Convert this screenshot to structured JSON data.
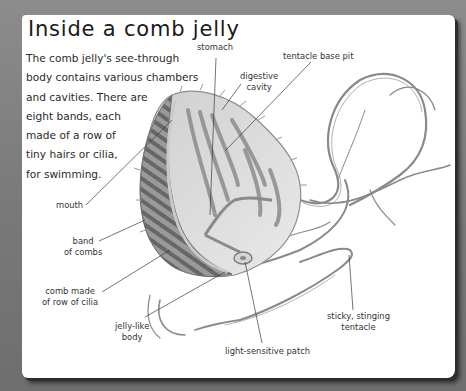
{
  "page": {
    "title": "Inside a comb jelly",
    "intro_lines": [
      "The comb jelly's see-through",
      "body contains various chambers",
      "and cavities. There are",
      "eight bands, each",
      "made of a row of",
      "tiny hairs or cilia,",
      "for swimming."
    ]
  },
  "labels": {
    "stomach": {
      "lines": [
        "stomach"
      ]
    },
    "tentacle_base_pit": {
      "lines": [
        "tentacle base pit"
      ]
    },
    "digestive_cavity": {
      "lines": [
        "digestive",
        "cavity"
      ]
    },
    "mouth": {
      "lines": [
        "mouth"
      ]
    },
    "band_of_combs": {
      "lines": [
        "band",
        "of combs"
      ]
    },
    "comb_made_of_cilia": {
      "lines": [
        "comb made",
        "of row of cilia"
      ]
    },
    "jelly_like_body": {
      "lines": [
        "jelly-like",
        "body"
      ]
    },
    "light_sensitive_patch": {
      "lines": [
        "light-sensitive patch"
      ]
    },
    "sticky_stinging_tentacle": {
      "lines": [
        "sticky, stinging",
        "tentacle"
      ]
    }
  },
  "colors": {
    "background": "#7a7a7a",
    "panel": "#ffffff",
    "text": "#2a2a2a",
    "leader_line": "#3a3a3a",
    "illustration_dark": "#6a6a6a",
    "illustration_mid": "#a8a8a8",
    "illustration_light": "#dcdcdc"
  }
}
